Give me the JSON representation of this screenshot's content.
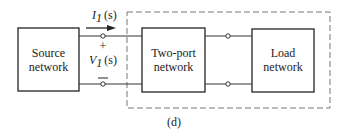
{
  "figure": {
    "caption": "(d)",
    "source_box": {
      "line1": "Source",
      "line2": "network"
    },
    "twoport_box": {
      "line1": "Two-port",
      "line2": "network"
    },
    "load_box": {
      "line1": "Load",
      "line2": "network"
    },
    "current_label": {
      "main": "I",
      "sub": "1",
      "arg": "(s)"
    },
    "voltage_label": {
      "main": "V",
      "sub": "1",
      "arg": "(s)"
    },
    "plus_sign": "+",
    "minus_sign": "—"
  }
}
